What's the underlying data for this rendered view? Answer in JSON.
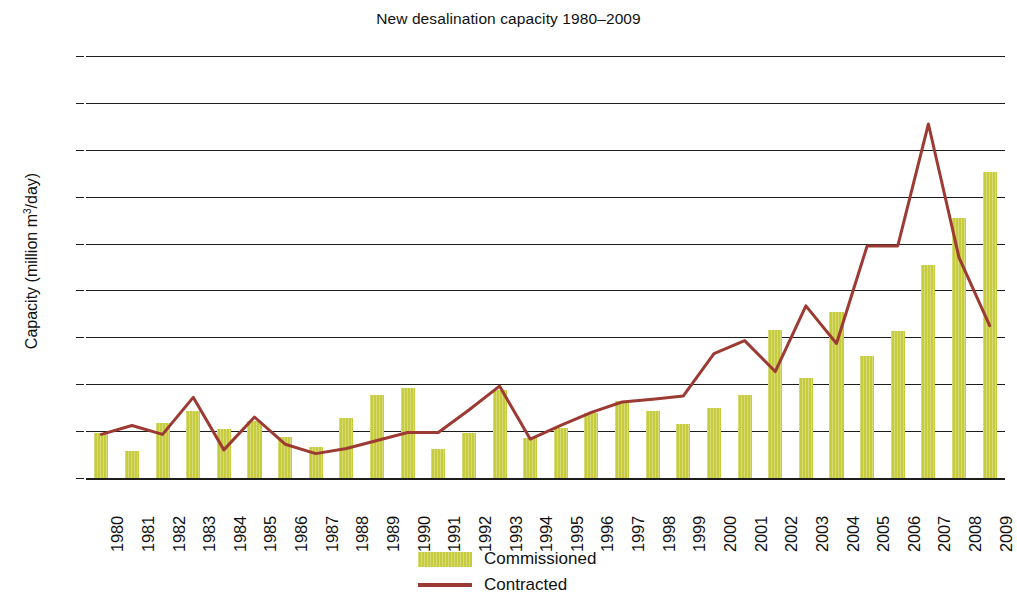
{
  "chart_data": {
    "type": "bar",
    "title": "New desalination capacity 1980–2009",
    "xlabel": "",
    "ylabel": "Capacity (million m³/day)",
    "ylim": [
      0,
      9
    ],
    "yticks": [
      0,
      1,
      2,
      3,
      4,
      5,
      6,
      7,
      8,
      9
    ],
    "ytick_labels": [
      "0",
      "1",
      "2",
      "3",
      "4",
      "5",
      "6",
      "7",
      "8",
      "9"
    ],
    "grid": true,
    "legend_position": "bottom-center",
    "categories": [
      "1980",
      "1981",
      "1982",
      "1983",
      "1984",
      "1985",
      "1986",
      "1987",
      "1988",
      "1989",
      "1990",
      "1991",
      "1992",
      "1993",
      "1994",
      "1995",
      "1996",
      "1997",
      "1998",
      "1999",
      "2000",
      "2001",
      "2002",
      "2003",
      "2004",
      "2005",
      "2006",
      "2007",
      "2008",
      "2009"
    ],
    "series": [
      {
        "name": "Commissioned",
        "kind": "bar",
        "color": "#c6cc3d",
        "values": [
          0.95,
          0.57,
          1.17,
          1.42,
          1.05,
          1.22,
          0.87,
          0.67,
          1.28,
          1.78,
          1.92,
          0.62,
          0.97,
          1.88,
          0.85,
          1.07,
          1.38,
          1.65,
          1.42,
          1.15,
          1.5,
          1.77,
          3.15,
          2.14,
          3.55,
          2.6,
          3.14,
          4.55,
          5.55,
          6.52
        ]
      },
      {
        "name": "Contracted",
        "kind": "line",
        "color": "#9c3a33",
        "values": [
          0.93,
          1.12,
          0.93,
          1.72,
          0.6,
          1.3,
          0.72,
          0.52,
          0.63,
          0.8,
          0.97,
          0.97,
          1.45,
          1.96,
          0.83,
          1.12,
          1.4,
          1.62,
          1.68,
          1.75,
          2.65,
          2.93,
          2.27,
          3.67,
          2.87,
          4.95,
          4.95,
          7.55,
          4.7,
          3.25
        ]
      }
    ]
  },
  "legend": {
    "items": [
      {
        "label": "Commissioned",
        "marker": "bar-swatch",
        "color": "#c6cc3d"
      },
      {
        "label": "Contracted",
        "marker": "line-swatch",
        "color": "#9c3a33"
      }
    ]
  },
  "style": {
    "background": "#ffffff",
    "axis_color": "#1d1d1d",
    "text_color": "#111111"
  }
}
